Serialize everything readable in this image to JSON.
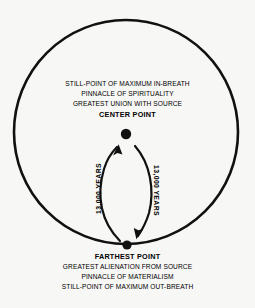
{
  "diagram": {
    "background_color": "#f7f7f6",
    "ink_color": "#111111",
    "circle": {
      "name": "orbit-circle",
      "center_x": 126,
      "center_y": 132,
      "radius": 112,
      "stroke_width": 2.6
    },
    "center_point": {
      "label": "CENTER POINT",
      "x": 126,
      "y": 134,
      "dot_radius": 5.2,
      "descriptions": [
        "STILL-POINT OF MAXIMUM IN-BREATH",
        "PINNACLE OF SPIRITUALITY",
        "GREATEST UNION WITH SOURCE"
      ]
    },
    "farthest_point": {
      "label": "FARTHEST POINT",
      "x": 127,
      "y": 245,
      "dot_radius": 4.6,
      "descriptions": [
        "GREATEST ALIENATION FROM SOURCE",
        "PINNACLE OF MATERIALISM",
        "STILL-POINT OF MAXIMUM OUT-BREATH"
      ]
    },
    "arrows": [
      {
        "name": "in-breath-arrow",
        "label": "13,000 YEARS",
        "direction": "upward",
        "side": "left"
      },
      {
        "name": "out-breath-arrow",
        "label": "13,000 YEARS",
        "direction": "downward",
        "side": "right"
      }
    ]
  }
}
